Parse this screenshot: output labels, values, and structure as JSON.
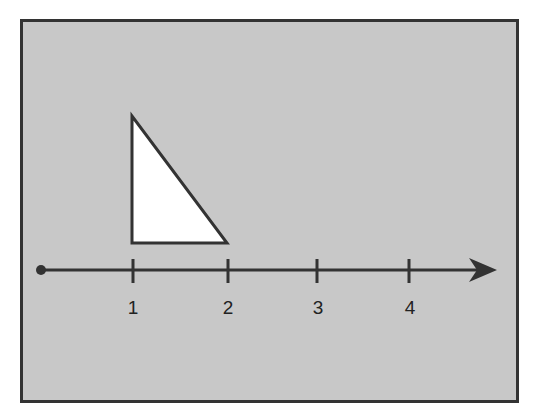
{
  "diagram": {
    "colors": {
      "panel_fill": "#c8c8c8",
      "panel_border": "#333333",
      "line": "#333333",
      "triangle_fill": "#ffffff"
    },
    "number_line": {
      "ticks": [
        {
          "value": 1,
          "label": "1"
        },
        {
          "value": 2,
          "label": "2"
        },
        {
          "value": 3,
          "label": "3"
        },
        {
          "value": 4,
          "label": "4"
        }
      ],
      "start_marker": "filled-dot",
      "end_marker": "arrow"
    },
    "triangle": {
      "type": "right-triangle",
      "base_start": 1,
      "base_end": 2
    }
  }
}
